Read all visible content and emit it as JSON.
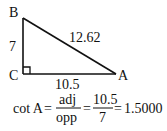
{
  "diagram": {
    "type": "right-triangle",
    "vertices": {
      "B": {
        "label": "B"
      },
      "C": {
        "label": "C",
        "right_angle": true
      },
      "A": {
        "label": "A"
      }
    },
    "sides": {
      "BC": {
        "label": "7"
      },
      "BA": {
        "label": "12.62"
      },
      "CA": {
        "label": "10.5"
      }
    }
  },
  "formula": {
    "lhs": "cot A",
    "eq1": "=",
    "frac1_num": "adj",
    "frac1_den": "opp",
    "eq2": "=",
    "frac2_num": "10.5",
    "frac2_den": "7",
    "eq3": "=",
    "result": "1.5000"
  },
  "colors": {
    "stroke": "#111111",
    "background": "#ffffff"
  }
}
